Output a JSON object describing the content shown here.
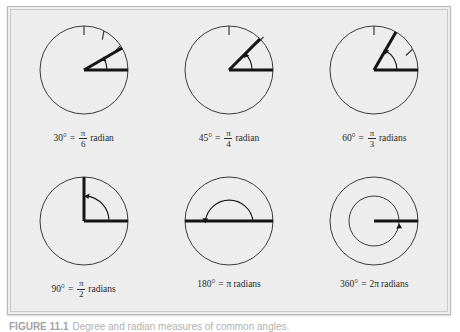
{
  "figure": {
    "label": "FIGURE 11.1",
    "caption": "Degree and radian measures of common angles."
  },
  "panels": [
    {
      "id": "angle-30",
      "degrees": "30°",
      "equals": "=",
      "numerator": "π",
      "denominator": "6",
      "unit": "radian",
      "angle_deg": 30,
      "arc_ticks": 3,
      "style": "ray"
    },
    {
      "id": "angle-45",
      "degrees": "45°",
      "equals": "=",
      "numerator": "π",
      "denominator": "4",
      "unit": "radian",
      "angle_deg": 45,
      "arc_ticks": 2,
      "style": "ray"
    },
    {
      "id": "angle-60",
      "degrees": "60°",
      "equals": "=",
      "numerator": "π",
      "denominator": "3",
      "unit": "radians",
      "angle_deg": 60,
      "arc_ticks": 2,
      "style": "ray"
    },
    {
      "id": "angle-90",
      "degrees": "90°",
      "equals": "=",
      "numerator": "π",
      "denominator": "2",
      "unit": "radians",
      "angle_deg": 90,
      "arc_ticks": 0,
      "style": "ray"
    },
    {
      "id": "angle-180",
      "degrees": "180°",
      "equals": "=",
      "numerator": null,
      "denominator": null,
      "coefficient": "π",
      "unit": "radians",
      "angle_deg": 180,
      "arc_ticks": 0,
      "style": "diameter"
    },
    {
      "id": "angle-360",
      "degrees": "360°",
      "equals": "=",
      "numerator": null,
      "denominator": null,
      "coefficient": "2π",
      "unit": "radians",
      "angle_deg": 360,
      "arc_ticks": 0,
      "style": "full-turn"
    }
  ],
  "colors": {
    "plate_background": "#ededed",
    "plate_border": "#b9b9b9",
    "circle_stroke": "#3a3a3a",
    "ray_stroke": "#141414",
    "text": "#2a2a2a",
    "caption_text": "#6f6f6f"
  }
}
